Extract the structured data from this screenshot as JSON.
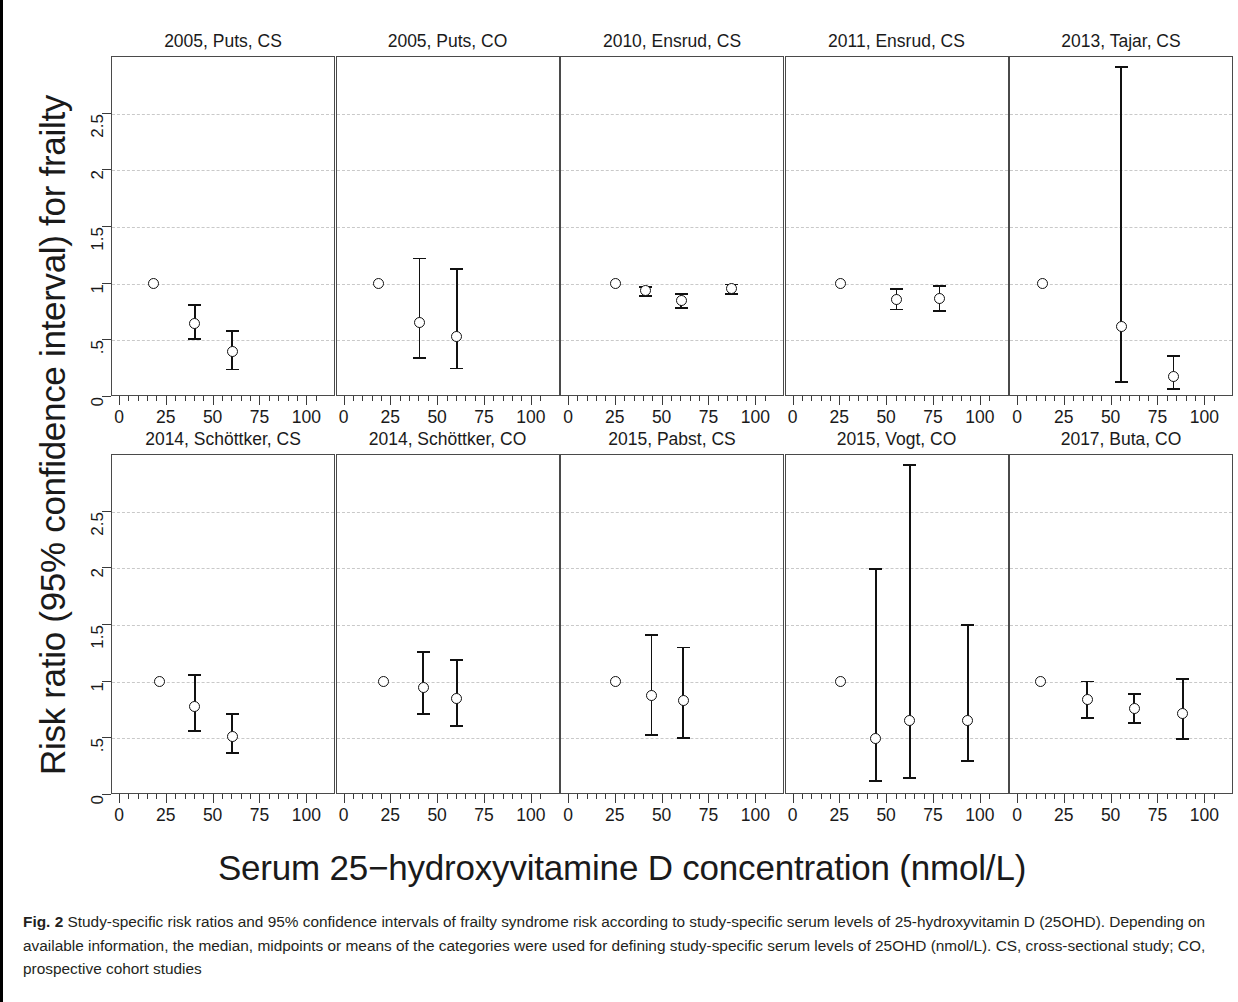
{
  "figure": {
    "ylabel": "Risk ratio (95% confidence interval) for frailty",
    "xlabel": "Serum 25−hydroxyvitamine D concentration (nmol/L)",
    "caption_label": "Fig. 2",
    "caption_text": " Study-specific risk ratios and 95% confidence intervals of frailty syndrome risk according to study-specific serum levels of 25-hydroxyvitamin D (25OHD). Depending on available information, the median, midpoints or means of the categories were used for defining study-specific serum levels of 25OHD (nmol/L). CS, cross-sectional study; CO, prospective cohort studies"
  },
  "chart_data": {
    "type": "scatter",
    "title": "Study-specific risk ratios and 95% confidence intervals of frailty syndrome risk",
    "xlabel": "Serum 25−hydroxyvitamine D concentration (nmol/L)",
    "ylabel": "Risk ratio (95% confidence interval) for frailty",
    "xlim": [
      0,
      110
    ],
    "ylim": [
      0,
      3.0
    ],
    "xticks": [
      0,
      25,
      50,
      75,
      100
    ],
    "xtick_labels": [
      "0",
      "25",
      "50",
      "75",
      "100"
    ],
    "xminor_step": 5,
    "yticks": [
      0,
      0.5,
      1,
      1.5,
      2,
      2.5
    ],
    "ytick_labels": [
      "0",
      ".5",
      "1",
      "1.5",
      "2",
      "2.5"
    ],
    "grid": "horizontal-dashed",
    "legend": "none",
    "marker": "open-circle",
    "panel_layout": [
      5,
      5
    ],
    "panels": [
      {
        "title": "2005, Puts, CS",
        "points": [
          {
            "x": 18,
            "rr": 1.0,
            "lcl": 1.0,
            "ucl": 1.0,
            "reference": true
          },
          {
            "x": 40,
            "rr": 0.65,
            "lcl": 0.52,
            "ucl": 0.82,
            "reference": false
          },
          {
            "x": 60,
            "rr": 0.4,
            "lcl": 0.25,
            "ucl": 0.59,
            "reference": false
          }
        ]
      },
      {
        "title": "2005, Puts, CO",
        "points": [
          {
            "x": 18,
            "rr": 1.0,
            "lcl": 1.0,
            "ucl": 1.0,
            "reference": true
          },
          {
            "x": 40,
            "rr": 0.66,
            "lcl": 0.35,
            "ucl": 1.23,
            "reference": false
          },
          {
            "x": 60,
            "rr": 0.53,
            "lcl": 0.26,
            "ucl": 1.14,
            "reference": false
          }
        ]
      },
      {
        "title": "2010, Ensrud, CS",
        "points": [
          {
            "x": 25,
            "rr": 1.0,
            "lcl": 1.0,
            "ucl": 1.0,
            "reference": true
          },
          {
            "x": 41,
            "rr": 0.94,
            "lcl": 0.9,
            "ucl": 0.98,
            "reference": false
          },
          {
            "x": 60,
            "rr": 0.85,
            "lcl": 0.79,
            "ucl": 0.92,
            "reference": false
          },
          {
            "x": 87,
            "rr": 0.96,
            "lcl": 0.92,
            "ucl": 1.0,
            "reference": false
          }
        ]
      },
      {
        "title": "2011, Ensrud, CS",
        "points": [
          {
            "x": 25,
            "rr": 1.0,
            "lcl": 1.0,
            "ucl": 1.0,
            "reference": true
          },
          {
            "x": 55,
            "rr": 0.86,
            "lcl": 0.78,
            "ucl": 0.96,
            "reference": false
          },
          {
            "x": 78,
            "rr": 0.87,
            "lcl": 0.77,
            "ucl": 0.99,
            "reference": false
          }
        ]
      },
      {
        "title": "2013, Tajar, CS",
        "points": [
          {
            "x": 13,
            "rr": 1.0,
            "lcl": 1.0,
            "ucl": 1.0,
            "reference": true
          },
          {
            "x": 55,
            "rr": 0.62,
            "lcl": 0.14,
            "ucl": 2.92,
            "reference": false
          },
          {
            "x": 83,
            "rr": 0.18,
            "lcl": 0.08,
            "ucl": 0.37,
            "reference": false
          }
        ]
      },
      {
        "title": "2014, Schöttker, CS",
        "points": [
          {
            "x": 21,
            "rr": 1.0,
            "lcl": 1.0,
            "ucl": 1.0,
            "reference": true
          },
          {
            "x": 40,
            "rr": 0.78,
            "lcl": 0.57,
            "ucl": 1.07,
            "reference": false
          },
          {
            "x": 60,
            "rr": 0.52,
            "lcl": 0.38,
            "ucl": 0.72,
            "reference": false
          }
        ]
      },
      {
        "title": "2014, Schöttker, CO",
        "points": [
          {
            "x": 21,
            "rr": 1.0,
            "lcl": 1.0,
            "ucl": 1.0,
            "reference": true
          },
          {
            "x": 42,
            "rr": 0.95,
            "lcl": 0.72,
            "ucl": 1.27,
            "reference": false
          },
          {
            "x": 60,
            "rr": 0.85,
            "lcl": 0.62,
            "ucl": 1.2,
            "reference": false
          }
        ]
      },
      {
        "title": "2015, Pabst, CS",
        "points": [
          {
            "x": 25,
            "rr": 1.0,
            "lcl": 1.0,
            "ucl": 1.0,
            "reference": true
          },
          {
            "x": 44,
            "rr": 0.88,
            "lcl": 0.54,
            "ucl": 1.42,
            "reference": false
          },
          {
            "x": 61,
            "rr": 0.83,
            "lcl": 0.51,
            "ucl": 1.31,
            "reference": false
          }
        ]
      },
      {
        "title": "2015, Vogt, CO",
        "points": [
          {
            "x": 25,
            "rr": 1.0,
            "lcl": 1.0,
            "ucl": 1.0,
            "reference": true
          },
          {
            "x": 44,
            "rr": 0.5,
            "lcl": 0.13,
            "ucl": 2.0,
            "reference": false
          },
          {
            "x": 62,
            "rr": 0.66,
            "lcl": 0.16,
            "ucl": 2.92,
            "reference": false
          },
          {
            "x": 93,
            "rr": 0.66,
            "lcl": 0.31,
            "ucl": 1.51,
            "reference": false
          }
        ]
      },
      {
        "title": "2017, Buta, CO",
        "points": [
          {
            "x": 12,
            "rr": 1.0,
            "lcl": 1.0,
            "ucl": 1.0,
            "reference": true
          },
          {
            "x": 37,
            "rr": 0.84,
            "lcl": 0.69,
            "ucl": 1.01,
            "reference": false
          },
          {
            "x": 62,
            "rr": 0.76,
            "lcl": 0.64,
            "ucl": 0.9,
            "reference": false
          },
          {
            "x": 88,
            "rr": 0.72,
            "lcl": 0.5,
            "ucl": 1.03,
            "reference": false
          }
        ]
      }
    ]
  }
}
